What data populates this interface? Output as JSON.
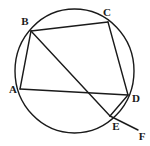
{
  "figure": {
    "type": "circle-geometry-diagram",
    "width": 150,
    "height": 146,
    "background_color": "#ffffff",
    "stroke_color": "#1a1a1a",
    "circle": {
      "name": "circumscribed-circle",
      "cx": 74.5,
      "cy": 71,
      "r": 62,
      "stroke_width": 1.4
    },
    "points": [
      {
        "id": "A",
        "label": "A",
        "x": 20,
        "y": 89,
        "label_x": 13,
        "label_y": 89
      },
      {
        "id": "B",
        "label": "B",
        "x": 31,
        "y": 31,
        "label_x": 25,
        "label_y": 21
      },
      {
        "id": "C",
        "label": "C",
        "x": 108,
        "y": 22,
        "label_x": 107,
        "label_y": 12
      },
      {
        "id": "D",
        "label": "D",
        "x": 128,
        "y": 95,
        "label_x": 136,
        "label_y": 98
      },
      {
        "id": "E",
        "label": "E",
        "x": 110,
        "y": 116,
        "label_x": 116,
        "label_y": 126
      },
      {
        "id": "F",
        "label": "F",
        "x": 138,
        "y": 130,
        "label_x": 142,
        "label_y": 136
      }
    ],
    "segments": [
      {
        "id": "AB",
        "from": "A",
        "to": "B",
        "x1": 20,
        "y1": 89,
        "x2": 31,
        "y2": 31
      },
      {
        "id": "BC",
        "from": "B",
        "to": "C",
        "x1": 31,
        "y1": 31,
        "x2": 108,
        "y2": 22
      },
      {
        "id": "CD",
        "from": "C",
        "to": "D",
        "x1": 108,
        "y1": 22,
        "x2": 128,
        "y2": 95
      },
      {
        "id": "AD",
        "from": "A",
        "to": "D",
        "x1": 20,
        "y1": 89,
        "x2": 128,
        "y2": 95
      },
      {
        "id": "BE",
        "from": "B",
        "to": "E",
        "x1": 31,
        "y1": 31,
        "x2": 110,
        "y2": 116
      },
      {
        "id": "ED",
        "from": "E",
        "to": "D",
        "x1": 110,
        "y1": 116,
        "x2": 128,
        "y2": 95
      },
      {
        "id": "EF",
        "from": "E",
        "to": "F",
        "x1": 110,
        "y1": 116,
        "x2": 138,
        "y2": 130
      }
    ]
  }
}
